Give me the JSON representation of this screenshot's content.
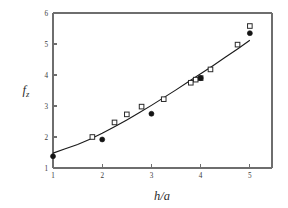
{
  "chart_data": {
    "type": "scatter",
    "title": "",
    "subtitle": "",
    "xlabel": "h/a",
    "ylabel": "f_z",
    "ylabel_base": "f",
    "ylabel_sub": "z",
    "xlim": [
      1,
      5.45
    ],
    "ylim": [
      1,
      6
    ],
    "xticks": [
      1,
      2,
      3,
      4,
      5
    ],
    "xtick_labels": [
      "1",
      "2",
      "3",
      "4",
      "5"
    ],
    "yticks": [
      1,
      2,
      3,
      4,
      5,
      6
    ],
    "ytick_labels": [
      "1",
      "2",
      "3",
      "4",
      "5",
      "6"
    ],
    "grid": false,
    "legend": "none",
    "frame": "box",
    "series": [
      {
        "name": "open-squares",
        "marker": "open-square",
        "color": "#2a2a2a",
        "points": [
          {
            "x": 1.8,
            "y": 2.0
          },
          {
            "x": 2.25,
            "y": 2.47
          },
          {
            "x": 2.5,
            "y": 2.73
          },
          {
            "x": 2.8,
            "y": 2.98
          },
          {
            "x": 3.25,
            "y": 3.22
          },
          {
            "x": 3.8,
            "y": 3.75
          },
          {
            "x": 3.9,
            "y": 3.85
          },
          {
            "x": 4.0,
            "y": 3.9
          },
          {
            "x": 4.2,
            "y": 4.18
          },
          {
            "x": 4.75,
            "y": 4.98
          },
          {
            "x": 5.0,
            "y": 5.58
          }
        ]
      },
      {
        "name": "filled-circles",
        "marker": "filled-circle",
        "color": "#141414",
        "points": [
          {
            "x": 1.0,
            "y": 1.38
          },
          {
            "x": 2.0,
            "y": 1.92
          },
          {
            "x": 3.0,
            "y": 2.75
          },
          {
            "x": 4.0,
            "y": 3.9
          },
          {
            "x": 5.0,
            "y": 5.35
          }
        ]
      }
    ],
    "fit_curve": {
      "name": "fitted-curve",
      "color": "#1a1a1a",
      "points": [
        {
          "x": 1.0,
          "y": 1.48
        },
        {
          "x": 1.25,
          "y": 1.62
        },
        {
          "x": 1.5,
          "y": 1.76
        },
        {
          "x": 1.75,
          "y": 1.93
        },
        {
          "x": 2.0,
          "y": 2.12
        },
        {
          "x": 2.25,
          "y": 2.33
        },
        {
          "x": 2.5,
          "y": 2.55
        },
        {
          "x": 2.75,
          "y": 2.78
        },
        {
          "x": 3.0,
          "y": 3.02
        },
        {
          "x": 3.25,
          "y": 3.27
        },
        {
          "x": 3.5,
          "y": 3.52
        },
        {
          "x": 3.75,
          "y": 3.78
        },
        {
          "x": 4.0,
          "y": 4.04
        },
        {
          "x": 4.25,
          "y": 4.3
        },
        {
          "x": 4.5,
          "y": 4.57
        },
        {
          "x": 4.75,
          "y": 4.84
        },
        {
          "x": 5.0,
          "y": 5.12
        }
      ]
    }
  }
}
